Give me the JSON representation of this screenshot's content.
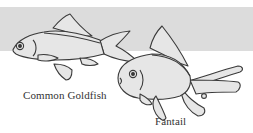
{
  "diagram": {
    "background_band_color": "#dcdcdc",
    "fish_fill_color": "#e4e4e4",
    "outline_color": "#3a3a3a",
    "fish": [
      {
        "id": "common-goldfish",
        "label": "Common Goldfish"
      },
      {
        "id": "fantail",
        "label": "Fantail"
      }
    ]
  }
}
